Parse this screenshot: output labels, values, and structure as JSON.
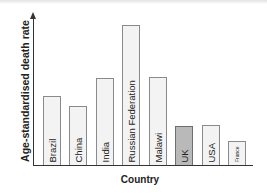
{
  "chart_data": {
    "type": "bar",
    "title": "",
    "xlabel": "Country",
    "ylabel": "Age-standardised death rate",
    "categories": [
      "Brazil",
      "China",
      "India",
      "Russian Federation",
      "Malawi",
      "UK",
      "USA",
      "France"
    ],
    "values": [
      49,
      42,
      62,
      100,
      63,
      28,
      29,
      17
    ],
    "value_units": "relative (Russian Federation = 100); no numeric axis ticks shown",
    "highlighted_category": "UK",
    "ylim": [
      0,
      106
    ],
    "grid": false,
    "legend": null,
    "colors": {
      "default_bar_fill": "#f3f3f3",
      "default_bar_border": "#8a8a8a",
      "highlight_bar_fill": "#b9b9b9",
      "highlight_bar_border": "#6e6e6e",
      "axis": "#333333"
    }
  },
  "axes": {
    "x_title": "Country",
    "y_title": "Age-standardised death rate"
  },
  "bars": [
    {
      "label": "Brazil",
      "left": 43,
      "height": 69
    },
    {
      "label": "China",
      "left": 69,
      "height": 59
    },
    {
      "label": "India",
      "left": 96,
      "height": 87
    },
    {
      "label": "Russian Federation",
      "left": 122,
      "height": 140
    },
    {
      "label": "Malawi",
      "left": 149,
      "height": 88
    },
    {
      "label": "UK",
      "left": 175,
      "height": 39
    },
    {
      "label": "USA",
      "left": 202,
      "height": 40
    },
    {
      "label": "France",
      "left": 228,
      "height": 24
    }
  ]
}
